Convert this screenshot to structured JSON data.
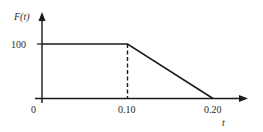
{
  "chart_data": {
    "type": "line",
    "title": "",
    "xlabel": "t",
    "ylabel": "F(t)",
    "x": [
      0,
      0.1,
      0.2
    ],
    "series": [
      {
        "name": "F(t)",
        "values": [
          100,
          100,
          0
        ],
        "style": "solid"
      }
    ],
    "annotations": [
      {
        "type": "dashed-vertical",
        "x": 0.1,
        "from_y": 0,
        "to_y": 100
      }
    ],
    "x_tick_labels": [
      "0",
      "0.10",
      "0.20"
    ],
    "y_tick_labels": [
      "100"
    ],
    "xlim": [
      0,
      0.2
    ],
    "ylim": [
      0,
      100
    ],
    "grid": false,
    "legend": "none"
  },
  "labels": {
    "y_axis": "F(t)",
    "x_axis": "t",
    "y_tick_100": "100",
    "x_tick_0": "0",
    "x_tick_010": "0.10",
    "x_tick_020": "0.20"
  },
  "colors": {
    "ink": "#1a1a1a",
    "background": "#ffffff"
  }
}
